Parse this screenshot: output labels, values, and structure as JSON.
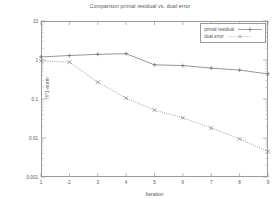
{
  "chart_data": {
    "type": "line",
    "title": "Comparison primal residual vs. dual error",
    "xlabel": "Iteration",
    "ylabel": "H^1-norm",
    "x": [
      1,
      2,
      3,
      4,
      5,
      6,
      7,
      8,
      9
    ],
    "xlim": [
      1,
      9
    ],
    "ylim": [
      0.001,
      10
    ],
    "yscale": "log",
    "xtick_labels": [
      "1",
      "2",
      "3",
      "4",
      "5",
      "6",
      "7",
      "8",
      "9"
    ],
    "ytick_labels": [
      "10",
      "1",
      "0.1",
      "0.01",
      "0.001"
    ],
    "ytick_values": [
      10,
      1,
      0.1,
      0.01,
      0.001
    ],
    "grid": false,
    "legend_position": "top-right",
    "series": [
      {
        "name": "primal residual",
        "values": [
          1.2,
          1.3,
          1.4,
          1.45,
          0.75,
          0.72,
          0.62,
          0.55,
          0.44
        ],
        "line_style": "solid",
        "marker": "plus",
        "color": "#6a6a6a"
      },
      {
        "name": "dual error",
        "values": [
          0.95,
          0.88,
          0.27,
          0.105,
          0.052,
          0.033,
          0.018,
          0.0095,
          0.0045
        ],
        "line_style": "dotted",
        "marker": "cross",
        "color": "#7a7a7a"
      }
    ]
  },
  "axis": {
    "frame_color": "#9a9a9a",
    "tick_color": "#9a9a9a"
  }
}
